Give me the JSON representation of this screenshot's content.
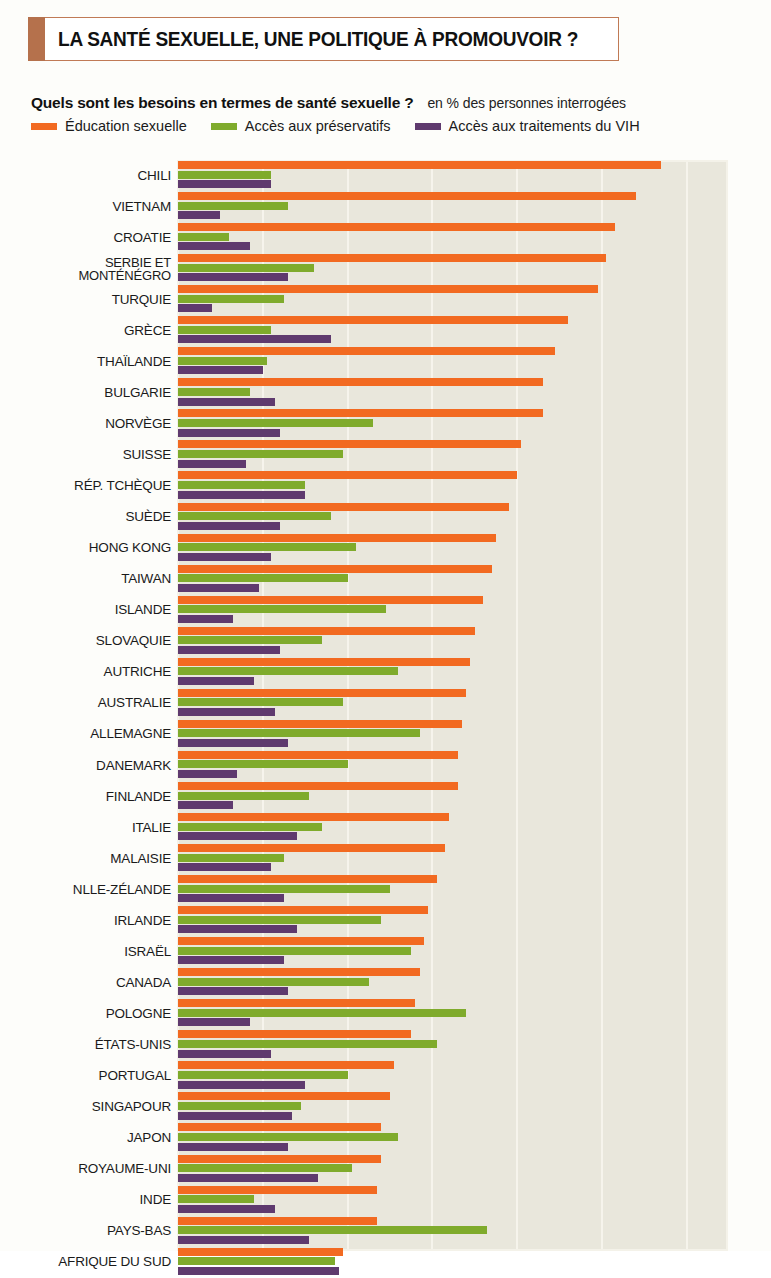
{
  "header": {
    "title": "LA SANTÉ SEXUELLE, UNE POLITIQUE À PROMOUVOIR ?",
    "question": "Quels sont les besoins en termes de santé sexuelle ?",
    "unit": "en % des personnes interrogées"
  },
  "colors": {
    "education": "#f26a21",
    "preservatifs": "#7fab2c",
    "vih": "#5f3a6e",
    "title_accent": "#b5714c",
    "title_border": "#c07a55",
    "plot_background": "#e9e7dc",
    "gridline": "#f6f4ec",
    "page_background": "#fdfdfa"
  },
  "chart_data": {
    "type": "bar",
    "orientation": "horizontal",
    "title": "LA SANTÉ SEXUELLE, UNE POLITIQUE À PROMOUVOIR ?",
    "subtitle": "Quels sont les besoins en termes de santé sexuelle ?",
    "xlabel": "en % des personnes interrogées",
    "ylabel": "",
    "xlim": [
      0,
      130
    ],
    "grid": true,
    "gridline_values": [
      20,
      40,
      60,
      80,
      100,
      120
    ],
    "legend_position": "top",
    "categories": [
      "CHILI",
      "VIETNAM",
      "CROATIE",
      "SERBIE ET MONTÉNÉGRO",
      "TURQUIE",
      "GRÈCE",
      "THAÏLANDE",
      "BULGARIE",
      "NORVÈGE",
      "SUISSE",
      "RÉP. TCHÈQUE",
      "SUÈDE",
      "HONG KONG",
      "TAIWAN",
      "ISLANDE",
      "SLOVAQUIE",
      "AUTRICHE",
      "AUSTRALIE",
      "ALLEMAGNE",
      "DANEMARK",
      "FINLANDE",
      "ITALIE",
      "MALAISIE",
      "NLLE-ZÉLANDE",
      "IRLANDE",
      "ISRAËL",
      "CANADA",
      "POLOGNE",
      "ÉTATS-UNIS",
      "PORTUGAL",
      "SINGAPOUR",
      "JAPON",
      "ROYAUME-UNI",
      "INDE",
      "PAYS-BAS",
      "AFRIQUE DU SUD"
    ],
    "series": [
      {
        "name": "Éducation sexuelle",
        "color": "#f26a21",
        "values": [
          114,
          108,
          103,
          101,
          99,
          92,
          89,
          86,
          86,
          81,
          80,
          78,
          75,
          74,
          72,
          70,
          69,
          68,
          67,
          66,
          66,
          64,
          63,
          61,
          59,
          58,
          57,
          56,
          55,
          51,
          50,
          48,
          48,
          47,
          47,
          39
        ]
      },
      {
        "name": "Accès aux préservatifs",
        "color": "#7fab2c",
        "values": [
          22,
          26,
          12,
          32,
          25,
          22,
          21,
          17,
          46,
          39,
          30,
          36,
          42,
          40,
          49,
          34,
          52,
          39,
          57,
          40,
          31,
          34,
          25,
          50,
          48,
          55,
          45,
          68,
          61,
          40,
          29,
          52,
          41,
          18,
          73,
          37
        ]
      },
      {
        "name": "Accès aux traitements du VIH",
        "color": "#5f3a6e",
        "values": [
          22,
          10,
          17,
          26,
          8,
          36,
          20,
          23,
          24,
          16,
          30,
          24,
          22,
          19,
          13,
          24,
          18,
          23,
          26,
          14,
          13,
          28,
          22,
          25,
          28,
          25,
          26,
          17,
          22,
          30,
          27,
          26,
          33,
          23,
          31,
          38
        ]
      }
    ]
  }
}
